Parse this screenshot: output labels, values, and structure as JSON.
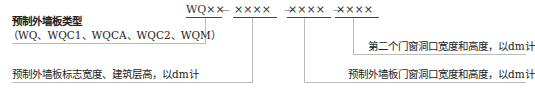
{
  "code": {
    "segments": [
      "WQ××",
      "××××",
      "××××",
      "××××"
    ],
    "separator": "—"
  },
  "labels": {
    "type_title": "预制外墙板类型",
    "type_options": "（WQ、WQC1、WQCA、WQC2、WQM）",
    "width_height": "预制外墙板标志宽度、建筑层高，以dm计",
    "opening": "预制外墙板门窗洞口宽度和高度，以dm计",
    "second_opening": "第二个门窗洞口宽度和高度，以dm计"
  },
  "colors": {
    "text": "#222222",
    "leader_line": "#bbbbbb",
    "underline": "#444444"
  }
}
